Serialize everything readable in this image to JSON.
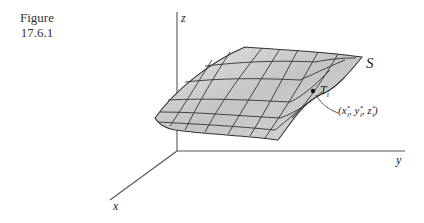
{
  "figure": {
    "caption_line1": "Figure",
    "caption_line2": "17.6.1"
  },
  "axes": {
    "x_label": "x",
    "y_label": "y",
    "z_label": "z"
  },
  "surface": {
    "label": "S",
    "patch_label": "T",
    "patch_subscript": "i",
    "point_label": "(x*i, y*i, z*i)",
    "fill_color": "#cfcfcf",
    "grid_color": "#333333"
  }
}
